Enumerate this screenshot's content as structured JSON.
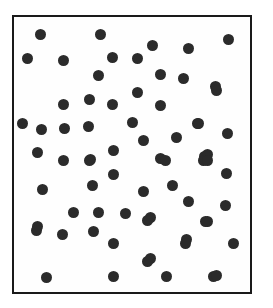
{
  "figure": {
    "title": "Random dot pattern",
    "description": "Filled circular markers scattered uniformly at random inside a rectangular frame",
    "background_color": "#ffffff"
  },
  "frame": {
    "name": "plot-frame",
    "x": 12,
    "y": 15,
    "width": 240,
    "height": 279,
    "border_color": "#1a1a1a",
    "border_width": 2,
    "fill_color": "#fefefe"
  },
  "chart_data": {
    "type": "scatter",
    "title": "Random dot pattern",
    "xlabel": "",
    "ylabel": "",
    "xlim": [
      12,
      252
    ],
    "ylim": [
      15,
      294
    ],
    "grid": false,
    "legend": null,
    "marker": {
      "shape": "circle",
      "color": "#2b2b2b",
      "diameter": 11
    },
    "point_count": 64,
    "points": [
      [
        40,
        34
      ],
      [
        100,
        34
      ],
      [
        228,
        39
      ],
      [
        152,
        45
      ],
      [
        188,
        48
      ],
      [
        27,
        58
      ],
      [
        112,
        57
      ],
      [
        137,
        58
      ],
      [
        63,
        60
      ],
      [
        98,
        75
      ],
      [
        160,
        74
      ],
      [
        183,
        78
      ],
      [
        215,
        86
      ],
      [
        137,
        92
      ],
      [
        216,
        90
      ],
      [
        89,
        99
      ],
      [
        63,
        104
      ],
      [
        160,
        105
      ],
      [
        112,
        104
      ],
      [
        132,
        122
      ],
      [
        22,
        123
      ],
      [
        41,
        129
      ],
      [
        64,
        128
      ],
      [
        88,
        126
      ],
      [
        197,
        123
      ],
      [
        198,
        123
      ],
      [
        227,
        133
      ],
      [
        176,
        137
      ],
      [
        143,
        140
      ],
      [
        113,
        150
      ],
      [
        37,
        152
      ],
      [
        160,
        158
      ],
      [
        204,
        156
      ],
      [
        207,
        154
      ],
      [
        90,
        159
      ],
      [
        63,
        160
      ],
      [
        89,
        160
      ],
      [
        165,
        160
      ],
      [
        203,
        160
      ],
      [
        207,
        160
      ],
      [
        226,
        173
      ],
      [
        113,
        174
      ],
      [
        92,
        185
      ],
      [
        42,
        189
      ],
      [
        172,
        185
      ],
      [
        143,
        191
      ],
      [
        188,
        201
      ],
      [
        225,
        205
      ],
      [
        73,
        212
      ],
      [
        98,
        212
      ],
      [
        125,
        213
      ],
      [
        150,
        217
      ],
      [
        147,
        220
      ],
      [
        207,
        221
      ],
      [
        205,
        221
      ],
      [
        37,
        226
      ],
      [
        62,
        234
      ],
      [
        93,
        231
      ],
      [
        36,
        230
      ],
      [
        186,
        239
      ],
      [
        113,
        243
      ],
      [
        185,
        243
      ],
      [
        233,
        243
      ],
      [
        150,
        258
      ],
      [
        147,
        261
      ],
      [
        113,
        276
      ],
      [
        166,
        276
      ],
      [
        213,
        276
      ],
      [
        216,
        275
      ],
      [
        46,
        277
      ]
    ]
  }
}
